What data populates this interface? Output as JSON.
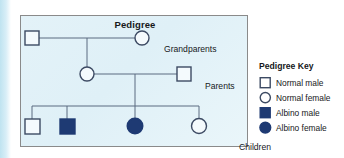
{
  "panel": {
    "title": "Pedigree",
    "labels": {
      "grandparents": "Grandparents",
      "parents": "Parents",
      "children": "Children"
    }
  },
  "legend": {
    "title": "Pedigree Key",
    "items": [
      {
        "label": "Normal male",
        "shape": "square",
        "fill": "open",
        "icon": "open-square-icon"
      },
      {
        "label": "Normal female",
        "shape": "circle",
        "fill": "open",
        "icon": "open-circle-icon"
      },
      {
        "label": "Albino male",
        "shape": "square",
        "fill": "filled",
        "icon": "filled-square-icon"
      },
      {
        "label": "Albino female",
        "shape": "circle",
        "fill": "filled",
        "icon": "filled-circle-icon"
      }
    ]
  },
  "pedigree": {
    "generations": [
      {
        "name": "grandparents",
        "individuals": [
          {
            "id": "I-1",
            "sex": "male",
            "phenotype": "normal",
            "shape": "square",
            "fill": "open"
          },
          {
            "id": "I-2",
            "sex": "female",
            "phenotype": "normal",
            "shape": "circle",
            "fill": "open"
          }
        ]
      },
      {
        "name": "parents",
        "individuals": [
          {
            "id": "II-1",
            "sex": "female",
            "phenotype": "normal",
            "shape": "circle",
            "fill": "open"
          },
          {
            "id": "II-2",
            "sex": "male",
            "phenotype": "normal",
            "shape": "square",
            "fill": "open"
          }
        ]
      },
      {
        "name": "children",
        "individuals": [
          {
            "id": "III-1",
            "sex": "male",
            "phenotype": "normal",
            "shape": "square",
            "fill": "open"
          },
          {
            "id": "III-2",
            "sex": "male",
            "phenotype": "albino",
            "shape": "square",
            "fill": "filled"
          },
          {
            "id": "III-3",
            "sex": "female",
            "phenotype": "albino",
            "shape": "circle",
            "fill": "filled"
          },
          {
            "id": "III-4",
            "sex": "female",
            "phenotype": "normal",
            "shape": "circle",
            "fill": "open"
          }
        ]
      }
    ]
  },
  "colors": {
    "filled": "#1e3a73",
    "outline": "#3c4a63",
    "line": "#5a6b80",
    "panel_background": "#e3f2f8",
    "panel_border": "#8a8a8a",
    "text": "#16181a",
    "accent_strip": "#bfe3f0"
  }
}
